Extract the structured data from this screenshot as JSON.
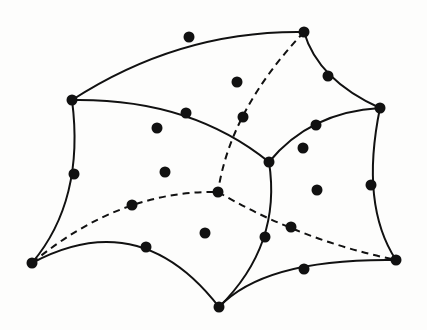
{
  "diagram": {
    "colors": {
      "stroke": "#111111",
      "background": "#fdfdfc",
      "node": "#111111"
    },
    "vertices": {
      "A": [
        72,
        100
      ],
      "C": [
        304,
        32
      ],
      "E": [
        380,
        108
      ],
      "G": [
        269,
        162
      ],
      "J": [
        32,
        263
      ],
      "L": [
        219,
        307
      ],
      "N": [
        396,
        260
      ],
      "Q": [
        218,
        192
      ]
    },
    "edges": [
      {
        "id": "A-C",
        "path": "M72,100 Q180,30 304,32",
        "style": "solid"
      },
      {
        "id": "C-E",
        "path": "M304,32 Q318,80 380,108",
        "style": "solid"
      },
      {
        "id": "A-G",
        "path": "M72,100 Q190,98 269,162",
        "style": "solid"
      },
      {
        "id": "E-G",
        "path": "M380,108 Q310,112 269,162",
        "style": "solid"
      },
      {
        "id": "A-J",
        "path": "M72,100 Q85,200 32,263",
        "style": "solid"
      },
      {
        "id": "J-L",
        "path": "M32,263 Q140,205 219,307",
        "style": "solid"
      },
      {
        "id": "G-L",
        "path": "M269,162 Q282,245 219,307",
        "style": "solid"
      },
      {
        "id": "L-N",
        "path": "M219,307 Q265,258 396,260",
        "style": "solid"
      },
      {
        "id": "E-N",
        "path": "M380,108 Q360,205 396,260",
        "style": "solid"
      },
      {
        "id": "C-Q",
        "path": "M304,32 Q230,110 218,192",
        "style": "dashed"
      },
      {
        "id": "J-Q",
        "path": "M32,263 Q120,190 218,192",
        "style": "dashed"
      },
      {
        "id": "Q-N",
        "path": "M218,192 Q300,240 396,260",
        "style": "dashed"
      }
    ],
    "nodes": [
      {
        "id": "A",
        "x": 72,
        "y": 100,
        "kind": "vertex"
      },
      {
        "id": "B",
        "x": 189,
        "y": 37,
        "kind": "edge-mid"
      },
      {
        "id": "C",
        "x": 304,
        "y": 32,
        "kind": "vertex"
      },
      {
        "id": "D",
        "x": 328,
        "y": 76,
        "kind": "edge-mid"
      },
      {
        "id": "E",
        "x": 380,
        "y": 108,
        "kind": "vertex"
      },
      {
        "id": "F",
        "x": 316,
        "y": 125,
        "kind": "edge-mid"
      },
      {
        "id": "G",
        "x": 269,
        "y": 162,
        "kind": "vertex"
      },
      {
        "id": "H",
        "x": 186,
        "y": 113,
        "kind": "edge-mid"
      },
      {
        "id": "I",
        "x": 74,
        "y": 174,
        "kind": "edge-mid"
      },
      {
        "id": "J",
        "x": 32,
        "y": 263,
        "kind": "vertex"
      },
      {
        "id": "K",
        "x": 146,
        "y": 247,
        "kind": "edge-mid"
      },
      {
        "id": "L",
        "x": 219,
        "y": 307,
        "kind": "vertex"
      },
      {
        "id": "M",
        "x": 304,
        "y": 269,
        "kind": "edge-mid"
      },
      {
        "id": "N",
        "x": 396,
        "y": 260,
        "kind": "vertex"
      },
      {
        "id": "O",
        "x": 371,
        "y": 185,
        "kind": "edge-mid"
      },
      {
        "id": "P",
        "x": 265,
        "y": 237,
        "kind": "edge-mid"
      },
      {
        "id": "Q",
        "x": 218,
        "y": 192,
        "kind": "hidden-vertex"
      },
      {
        "id": "R",
        "x": 243,
        "y": 117,
        "kind": "hidden-edge-mid"
      },
      {
        "id": "S",
        "x": 132,
        "y": 205,
        "kind": "hidden-edge-mid"
      },
      {
        "id": "T",
        "x": 291,
        "y": 227,
        "kind": "hidden-edge-mid"
      },
      {
        "id": "F1",
        "x": 237,
        "y": 82,
        "kind": "face-center"
      },
      {
        "id": "F2",
        "x": 157,
        "y": 128,
        "kind": "face-center"
      },
      {
        "id": "F3",
        "x": 165,
        "y": 172,
        "kind": "face-center"
      },
      {
        "id": "F4",
        "x": 303,
        "y": 148,
        "kind": "face-center"
      },
      {
        "id": "F5",
        "x": 317,
        "y": 190,
        "kind": "face-center"
      },
      {
        "id": "F6",
        "x": 205,
        "y": 233,
        "kind": "face-center"
      }
    ],
    "node_radius": 5.5
  }
}
